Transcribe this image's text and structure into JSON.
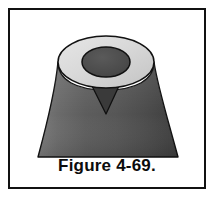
{
  "figure": {
    "caption": "Figure 4-69.",
    "alt_description": "Shaded drawing of a truncated cone / volcano-like solid with a flared concave base, a flat elliptical top face and a circular hole through the top face, with a small V-shaped notch below the near rim.",
    "background_color": "#ffffff",
    "border_color": "#111111",
    "colors": {
      "outline": "#111111",
      "cone_body_light": "#6e6e6e",
      "cone_body_mid": "#5a5a5a",
      "cone_body_dark": "#3f3f3f",
      "top_face_ring": "#d8d8d8",
      "top_face_ring_shade": "#c2c2c2",
      "crater_fill": "#4a4a4a",
      "notch_fill": "#3a3a3a",
      "caption_text": "#0c0c0c"
    },
    "geometry": {
      "top_ellipse": {
        "cx": 106,
        "cy": 62,
        "rx": 48,
        "ry": 26
      },
      "crater_ellipse": {
        "cx": 106,
        "cy": 62,
        "rx": 24,
        "ry": 15
      },
      "base_left_x": 38,
      "base_right_x": 178,
      "base_y": 157,
      "notch": {
        "left_x": 92,
        "right_x": 119,
        "apex_x": 106,
        "apex_y": 114,
        "top_y": 88
      }
    }
  }
}
